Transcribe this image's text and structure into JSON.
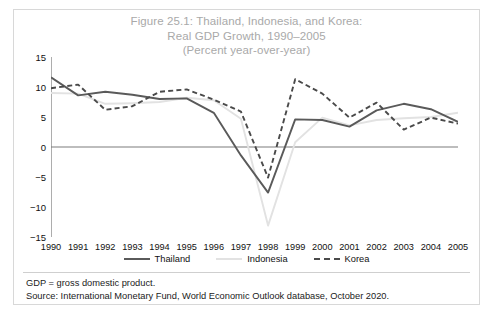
{
  "figure": {
    "title_lines": [
      "Figure 25.1: Thailand, Indonesia, and Korea:",
      "Real GDP Growth, 1990–2005",
      "(Percent year-over-year)"
    ],
    "title_color": "#a9a9a9",
    "background_color": "#ffffff",
    "border_color": "#d8d8d8"
  },
  "footnotes": [
    "GDP = gross domestic product.",
    "Source: International Monetary Fund, World Economic Outlook database, October 2020."
  ],
  "chart_data": {
    "type": "line",
    "title": "Figure 25.1: Thailand, Indonesia, and Korea: Real GDP Growth, 1990–2005 (Percent year-over-year)",
    "xlabel": "",
    "ylabel": "",
    "categories": [
      "1990",
      "1991",
      "1992",
      "1993",
      "1994",
      "1995",
      "1996",
      "1997",
      "1998",
      "1999",
      "2000",
      "2001",
      "2002",
      "2003",
      "2004",
      "2005"
    ],
    "ylim": [
      -15,
      15
    ],
    "yticks": [
      15,
      10,
      5,
      0,
      -5,
      -10,
      -15
    ],
    "ytick_labels": [
      "15",
      "10",
      "5",
      "0",
      "−5",
      "−10",
      "−15"
    ],
    "grid": false,
    "zero_line": true,
    "legend_position": "below",
    "series": [
      {
        "name": "Thailand",
        "color": "#5a5a5a",
        "style": "solid",
        "values": [
          11.6,
          8.6,
          9.2,
          8.7,
          8.0,
          8.1,
          5.7,
          -1.4,
          -7.6,
          4.6,
          4.5,
          3.4,
          6.1,
          7.2,
          6.3,
          4.2
        ]
      },
      {
        "name": "Indonesia",
        "color": "#e2e2e2",
        "style": "solid",
        "values": [
          9.0,
          8.9,
          7.2,
          7.3,
          7.5,
          8.2,
          7.8,
          4.7,
          -13.1,
          0.8,
          4.9,
          3.6,
          4.5,
          4.8,
          5.0,
          5.7
        ]
      },
      {
        "name": "Korea",
        "color": "#4a4a4a",
        "style": "dashed",
        "values": [
          9.8,
          10.4,
          6.2,
          6.8,
          9.2,
          9.6,
          7.9,
          5.9,
          -5.1,
          11.3,
          8.9,
          4.9,
          7.4,
          2.9,
          4.9,
          3.9
        ]
      }
    ]
  }
}
